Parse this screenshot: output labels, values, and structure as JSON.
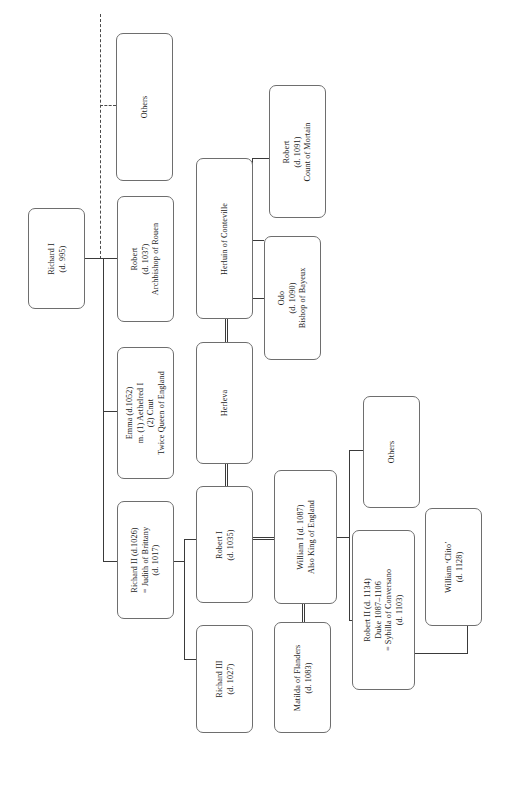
{
  "diagram": {
    "orientation": "rotated-90",
    "line_color": "#3a3a3a",
    "box_border_color": "#6e6e6e",
    "background": "#ffffff"
  },
  "nodes": {
    "others_top": {
      "lines": [
        "Others"
      ]
    },
    "richard_i": {
      "lines": [
        "Richard I",
        "(d. 995)"
      ]
    },
    "robert_rouen": {
      "lines": [
        "Robert",
        "(d. 1037)",
        "Archbishop of Rouen"
      ]
    },
    "emma": {
      "lines": [
        "Emma (d.1052)",
        "m. (1) Aethelred I",
        "(2) Cnut",
        "Twice Queen of England"
      ]
    },
    "richard_ii": {
      "lines": [
        "Richard II (d.1026)",
        "= Judith of Brittany",
        "(d. 1017)"
      ]
    },
    "herluin": {
      "lines": [
        "Herluin of Conteville"
      ]
    },
    "herleva": {
      "lines": [
        "Herleva"
      ]
    },
    "robert_i": {
      "lines": [
        "Robert I",
        "(d. 1035)"
      ]
    },
    "richard_iii": {
      "lines": [
        "Richard III",
        "(d. 1027)"
      ]
    },
    "robert_mortain": {
      "lines": [
        "Robert",
        "(d. 1091)",
        "Count of Mortain"
      ]
    },
    "odo": {
      "lines": [
        "Odo",
        "(d. 1090)",
        "Bishop of Bayeux"
      ]
    },
    "william_i": {
      "lines": [
        "William I (d. 1087)",
        "Also King of England"
      ]
    },
    "matilda": {
      "lines": [
        "Matilda of Flanders",
        "(d. 1083)"
      ]
    },
    "others_right": {
      "lines": [
        "Others"
      ]
    },
    "robert_ii": {
      "lines": [
        "Robert II (d. 1134)",
        "Duke 1087–1106",
        "= Sybilla of Conversano",
        "(d. 1103)"
      ]
    },
    "william_clito": {
      "lines": [
        "William ‘Clito’",
        "(d. 1128)"
      ]
    }
  }
}
